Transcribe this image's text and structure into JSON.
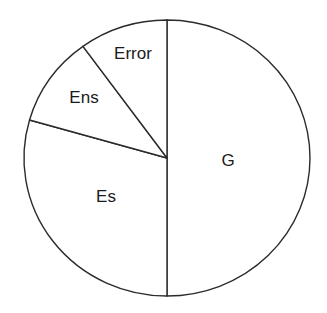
{
  "chart_data": {
    "type": "pie",
    "title": "",
    "subtitle": "",
    "xlabel": "",
    "ylabel": "",
    "grid": false,
    "legend_position": "none",
    "labels_inside_slices": true,
    "start_angle_deg": 90,
    "direction": "counterclockwise",
    "categories": [
      "G",
      "Es",
      "Ens",
      "Error"
    ],
    "values": [
      50,
      29.4,
      10.6,
      10
    ],
    "units": "percent",
    "slices": [
      {
        "label": "G",
        "value": 50,
        "percent": 50,
        "sweep_deg": 180,
        "start_deg": 90,
        "end_deg": -90,
        "fill": "#ffffff",
        "stroke": "#2b2b2b",
        "label_x": 228,
        "label_y": 162
      },
      {
        "label": "Es",
        "value": 29.4,
        "percent": 29.4,
        "sweep_deg": 106,
        "start_deg": 270,
        "end_deg": 164,
        "fill": "#ffffff",
        "stroke": "#2b2b2b",
        "label_x": 106,
        "label_y": 198
      },
      {
        "label": "Ens",
        "value": 10.6,
        "percent": 10.6,
        "sweep_deg": 38,
        "start_deg": 164,
        "end_deg": 126,
        "fill": "#ffffff",
        "stroke": "#2b2b2b",
        "label_x": 84,
        "label_y": 99
      },
      {
        "label": "Error",
        "value": 10,
        "percent": 10,
        "sweep_deg": 36,
        "start_deg": 126,
        "end_deg": 90,
        "fill": "#ffffff",
        "stroke": "#2b2b2b",
        "label_x": 133,
        "label_y": 55
      }
    ],
    "geometry": {
      "center_x": 167,
      "center_y": 158,
      "radius_x": 143,
      "radius_y": 138
    },
    "colors": {
      "background": "#ffffff",
      "stroke": "#2b2b2b",
      "label_text": "#1a1a1a"
    }
  }
}
